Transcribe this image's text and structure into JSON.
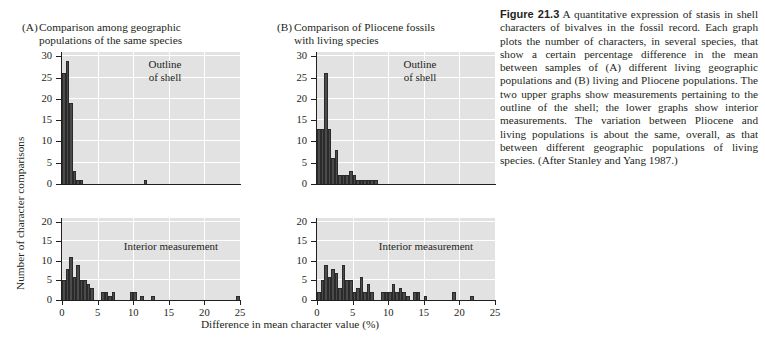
{
  "figure": {
    "number": "Figure 21.3",
    "caption": " A quantitative expression of stasis in shell characters of bivalves in the fossil record. Each graph plots the number of characters, in several species, that show a certain percentage difference in the mean between samples of (A) different living geographic populations and (B) living and Pliocene populations. The two upper graphs show measurements pertaining to the outline of the shell; the lower graphs show interior measurements. The variation between Pliocene and living populations is about the same, overall, as that between different geographic populations of living species. (After Stanley and Yang 1987.)"
  },
  "panels": {
    "a": {
      "letter": "(A)",
      "title": "Comparison among geographic\npopulations of the same species"
    },
    "b": {
      "letter": "(B)",
      "title": "Comparison of Pliocene fossils\nwith living species"
    }
  },
  "axes": {
    "ylabel": "Number of character comparisons",
    "xlabel": "Difference in mean character value (%)",
    "xticks_top": [
      0,
      5,
      10,
      15,
      20,
      25
    ],
    "xticks_bottom": [
      0,
      5,
      10,
      15,
      20,
      25
    ],
    "yticks_top": [
      0,
      5,
      10,
      15,
      20,
      25,
      30
    ],
    "yticks_bottom": [
      0,
      5,
      10,
      15,
      20
    ]
  },
  "colors": {
    "plot_background": "#e2e2e2",
    "grid": "#ffffff",
    "bar_fill": "#4b4b4b",
    "axis": "#231f20",
    "text": "#231f20"
  },
  "chart_data": [
    {
      "id": "A-outline",
      "type": "bar",
      "title": "Outline\nof shell",
      "panel": "A",
      "xlabel": "Difference in mean character value (%)",
      "ylabel": "Number of character comparisons",
      "xlim": [
        0,
        25
      ],
      "ylim": [
        0,
        31
      ],
      "bin_width": 0.5,
      "grid": true,
      "bins": [
        0.0,
        0.5,
        1.0,
        1.5,
        2.0,
        2.5,
        3.0,
        3.5,
        4.0,
        4.5,
        5.0,
        11.5
      ],
      "values": [
        26,
        29,
        19,
        3,
        1,
        1,
        0,
        0,
        0,
        0,
        0,
        1
      ]
    },
    {
      "id": "B-outline",
      "type": "bar",
      "title": "Outline\nof shell",
      "panel": "B",
      "xlabel": "Difference in mean character value (%)",
      "ylabel": "Number of character comparisons",
      "xlim": [
        0,
        25
      ],
      "ylim": [
        0,
        31
      ],
      "bin_width": 0.5,
      "grid": true,
      "bins": [
        0.0,
        0.5,
        1.0,
        1.5,
        2.0,
        2.5,
        3.0,
        3.5,
        4.0,
        4.5,
        5.0,
        5.5,
        6.0,
        6.5,
        7.0,
        7.5,
        8.0
      ],
      "values": [
        13,
        13,
        26,
        13,
        6,
        8,
        2,
        2,
        2,
        3,
        2,
        1,
        1,
        1,
        1,
        1,
        1
      ]
    },
    {
      "id": "C-interior",
      "type": "bar",
      "title": "Interior measurement",
      "panel": "A",
      "xlabel": "Difference in mean character value (%)",
      "ylabel": "Number of character comparisons",
      "xlim": [
        0,
        25
      ],
      "ylim": [
        0,
        21
      ],
      "bin_width": 0.5,
      "grid": true,
      "bins": [
        0.0,
        0.5,
        1.0,
        1.5,
        2.0,
        2.5,
        3.0,
        3.5,
        4.0,
        4.5,
        5.5,
        6.0,
        6.5,
        7.0,
        9.5,
        10.0,
        11.0,
        12.5,
        24.5
      ],
      "values": [
        5,
        8,
        11,
        6,
        9,
        5,
        5,
        4,
        3,
        0,
        2,
        2,
        1,
        2,
        2,
        2,
        1,
        1,
        1
      ]
    },
    {
      "id": "D-interior",
      "type": "bar",
      "title": "Interior measurement",
      "panel": "B",
      "xlabel": "Difference in mean character value (%)",
      "ylabel": "Number of character comparisons",
      "xlim": [
        0,
        25
      ],
      "ylim": [
        0,
        21
      ],
      "bin_width": 0.5,
      "grid": true,
      "bins": [
        0.0,
        0.5,
        1.0,
        1.5,
        2.0,
        2.5,
        3.0,
        3.5,
        4.0,
        4.5,
        5.0,
        5.5,
        6.0,
        6.5,
        7.0,
        7.5,
        9.0,
        9.5,
        10.0,
        10.5,
        11.0,
        11.5,
        12.0,
        12.5,
        13.5,
        14.0,
        15.0,
        19.0,
        21.5
      ],
      "values": [
        2,
        5,
        9,
        6,
        8,
        7,
        3,
        9,
        5,
        5,
        2,
        3,
        6,
        2,
        4,
        2,
        2,
        2,
        2,
        4,
        2,
        3,
        2,
        1,
        2,
        2,
        1,
        2,
        1
      ]
    }
  ],
  "inplot_labels": {
    "outline": "Outline\nof shell",
    "interior": "Interior measurement"
  }
}
